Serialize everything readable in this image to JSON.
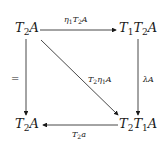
{
  "diagram": {
    "nodes": {
      "top_left": {
        "base": "T",
        "sub": "2",
        "rest": "A"
      },
      "top_right": {
        "t1": "T",
        "s1": "1",
        "t2": "T",
        "s2": "2",
        "rest": "A"
      },
      "bottom_left": {
        "base": "T",
        "sub": "2",
        "rest": "A"
      },
      "bottom_right": {
        "t1": "T",
        "s1": "2",
        "t2": "T",
        "s2": "1",
        "rest": "A"
      }
    },
    "arrows": {
      "top": {
        "from": "T2A",
        "to": "T1T2A",
        "label_pre": "η",
        "label_sub1": "1",
        "label_mid": "T",
        "label_sub2": "2",
        "label_post": "A"
      },
      "left": {
        "from": "T2A",
        "to": "T2A",
        "label": "="
      },
      "right": {
        "from": "T1T2A",
        "to": "T2T1A",
        "label": "λA"
      },
      "diagonal": {
        "from": "T2A",
        "to": "T2T1A",
        "label_pre": "T",
        "label_sub1": "2",
        "label_mid": "η",
        "label_sub2": "1",
        "label_post": "A"
      },
      "bottom": {
        "from": "T2T1A",
        "to": "T2A",
        "label_pre": "T",
        "label_sub": "2",
        "label_post": "a"
      }
    }
  }
}
